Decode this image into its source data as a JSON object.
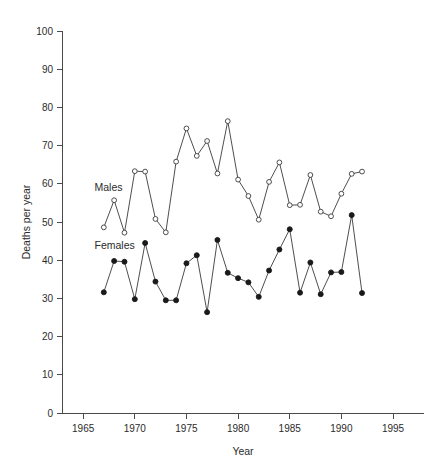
{
  "chart_data": {
    "type": "line",
    "title": "",
    "xlabel": "Year",
    "ylabel": "Deaths per year",
    "xlim": [
      1963,
      1998
    ],
    "ylim": [
      0,
      100
    ],
    "xticks": [
      1965,
      1970,
      1975,
      1980,
      1985,
      1990,
      1995
    ],
    "yticks": [
      0,
      10,
      20,
      30,
      40,
      50,
      60,
      70,
      80,
      90,
      100
    ],
    "grid": false,
    "legend_position": "inline-annotation",
    "x": [
      1967,
      1968,
      1969,
      1970,
      1971,
      1972,
      1973,
      1974,
      1975,
      1976,
      1977,
      1978,
      1979,
      1980,
      1981,
      1982,
      1983,
      1984,
      1985,
      1986,
      1987,
      1988,
      1989,
      1990,
      1991,
      1992
    ],
    "series": [
      {
        "name": "Males",
        "marker": "open-circle",
        "values": [
          48.6,
          55.7,
          47.2,
          63.3,
          63.2,
          50.8,
          47.3,
          65.8,
          74.5,
          67.3,
          71.2,
          62.7,
          76.4,
          61.1,
          56.8,
          50.6,
          60.5,
          65.6,
          54.4,
          54.5,
          62.3,
          52.7,
          51.5,
          57.4,
          62.6,
          63.2
        ]
      },
      {
        "name": "Females",
        "marker": "filled-circle",
        "values": [
          31.6,
          39.8,
          39.6,
          29.8,
          44.5,
          34.4,
          29.5,
          29.5,
          39.2,
          41.3,
          26.4,
          45.3,
          36.7,
          35.3,
          34.2,
          30.4,
          37.3,
          42.8,
          48.1,
          31.5,
          39.4,
          31.1,
          36.8,
          36.9,
          51.8,
          31.4
        ]
      }
    ],
    "annotations": [
      {
        "text": "Males",
        "x": 1966.1,
        "y": 58.0
      },
      {
        "text": "Females",
        "x": 1966.1,
        "y": 43.0
      }
    ]
  }
}
